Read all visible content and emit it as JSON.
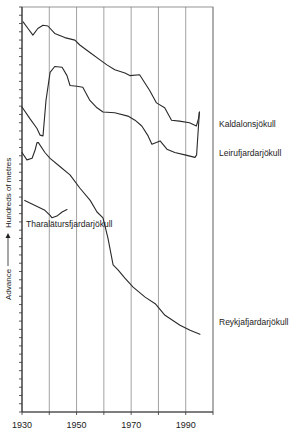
{
  "chart_data": {
    "type": "line",
    "title": "",
    "xlabel": "",
    "ylabel": "Advance ——→ Hundreds of metres",
    "ylabel_parts": {
      "left": "Advance",
      "right": "Hundreds of metres"
    },
    "xlim": [
      1930,
      2000
    ],
    "ylim": [
      0,
      49
    ],
    "x_ticks": [
      1930,
      1950,
      1970,
      1990
    ],
    "x_gridlines": [
      1930,
      1940,
      1950,
      1960,
      1970,
      1980,
      1990,
      2000
    ],
    "y_minor_tick_step": 1,
    "grid": "vertical",
    "legend": "inline-right",
    "series": [
      {
        "name": "Kaldalonsjökull",
        "x": [
          1930.4,
          1932.2,
          1934.0,
          1935.8,
          1937.7,
          1939.5,
          1942.0,
          1945.7,
          1949.4,
          1951.2,
          1954.9,
          1958.6,
          1961.1,
          1964.0,
          1967.7,
          1969.5,
          1973.1,
          1976.8,
          1979.3,
          1982.3,
          1984.8,
          1987.7,
          1991.4,
          1993.9,
          1994.7,
          1995.0
        ],
        "y": [
          47.2,
          46.4,
          45.6,
          46.4,
          46.8,
          46.7,
          45.8,
          45.3,
          45.0,
          44.4,
          43.5,
          42.6,
          42.0,
          41.4,
          41.0,
          40.7,
          40.8,
          38.9,
          37.4,
          36.8,
          35.3,
          35.2,
          35.0,
          34.6,
          35.5,
          36.3
        ]
      },
      {
        "name": "Leirufjardarjökull",
        "x": [
          1930.0,
          1932.9,
          1935.5,
          1936.6,
          1937.7,
          1938.8,
          1940.3,
          1942.0,
          1944.7,
          1946.5,
          1947.6,
          1950.1,
          1952.3,
          1954.9,
          1957.5,
          1959.7,
          1964.0,
          1968.8,
          1971.4,
          1973.9,
          1976.2,
          1977.6,
          1980.6,
          1983.1,
          1986.0,
          1989.7,
          1993.4,
          1994.0,
          1995.0
        ],
        "y": [
          36.9,
          35.5,
          34.3,
          33.5,
          33.4,
          37.7,
          41.1,
          41.8,
          41.7,
          40.7,
          39.5,
          39.4,
          39.3,
          37.7,
          36.8,
          36.3,
          36.2,
          35.8,
          35.3,
          34.6,
          33.4,
          32.4,
          32.8,
          31.8,
          31.4,
          31.1,
          30.8,
          31.1,
          36.3
        ]
      },
      {
        "name": "Reykjafjardarjökull",
        "x": [
          1930.0,
          1931.8,
          1933.7,
          1934.8,
          1935.5,
          1936.0,
          1938.4,
          1940.3,
          1943.9,
          1947.6,
          1951.2,
          1955.0,
          1957.5,
          1959.7,
          1961.5,
          1963.4,
          1965.2,
          1967.7,
          1970.7,
          1975.1,
          1978.8,
          1982.4,
          1987.9,
          1991.6,
          1995.2
        ],
        "y": [
          31.4,
          30.5,
          30.7,
          31.7,
          32.6,
          32.6,
          31.4,
          30.7,
          29.7,
          28.7,
          27.1,
          25.6,
          24.2,
          23.5,
          21.0,
          17.8,
          17.2,
          16.2,
          15.1,
          13.9,
          13.1,
          11.7,
          10.5,
          9.9,
          9.4
        ]
      },
      {
        "name": "Tharalätursfjardarjökull",
        "x": [
          1931.0,
          1934.8,
          1938.4,
          1940.3,
          1941.0,
          1942.8,
          1944.7,
          1946.5
        ],
        "y": [
          25.6,
          25.0,
          24.4,
          23.8,
          23.5,
          23.7,
          24.2,
          24.5
        ]
      }
    ]
  }
}
